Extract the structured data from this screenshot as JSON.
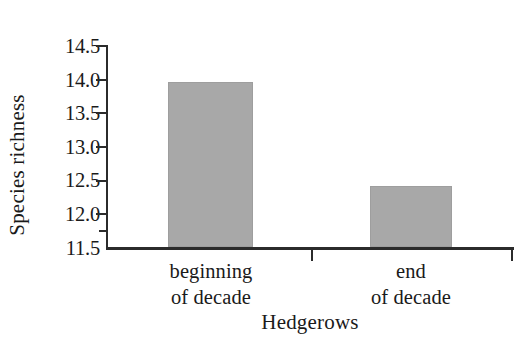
{
  "chart_data": {
    "type": "bar",
    "title": "",
    "xlabel": "Hedgerows",
    "ylabel": "Species richness",
    "categories": [
      "beginning of decade",
      "end of decade"
    ],
    "category_lines": [
      {
        "line1": "beginning",
        "line2": "of decade"
      },
      {
        "line1": "end",
        "line2": "of decade"
      }
    ],
    "values": [
      13.95,
      12.4
    ],
    "ylim": [
      11.5,
      14.5
    ],
    "yticks": [
      11.5,
      12.0,
      12.5,
      13.0,
      13.5,
      14.0,
      14.5
    ],
    "ytick_labels": [
      "11.5",
      "12.0",
      "12.5",
      "13.0",
      "13.5",
      "14.0",
      "14.5"
    ],
    "yminor_ticks": [
      11.75
    ],
    "grid": false,
    "legend": null,
    "bar_color": "#a8a8a8",
    "axis_color": "#2b2b2b",
    "background": "#ffffff"
  },
  "axis": {
    "y_title": "Species richness",
    "x_title": "Hedgerows",
    "ytick_labels": {
      "t0": "11.5",
      "t1": "12.0",
      "t2": "12.5",
      "t3": "13.0",
      "t4": "13.5",
      "t5": "14.0",
      "t6": "14.5"
    }
  },
  "bars": [
    {
      "label_line1": "beginning",
      "label_line2": "of decade",
      "value": "13.95"
    },
    {
      "label_line1": "end",
      "label_line2": "of decade",
      "value": "12.4"
    }
  ]
}
